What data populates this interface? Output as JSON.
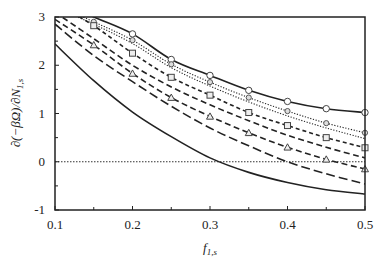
{
  "chart_data": {
    "type": "line",
    "title": "",
    "xlabel": "f_{1,s}",
    "ylabel": "∂(−βΩ)/∂N_{1,s}",
    "xlim": [
      0.1,
      0.5
    ],
    "ylim": [
      -1,
      3
    ],
    "xticks": [
      "0.1",
      "0.2",
      "0.3",
      "0.4",
      "0.5"
    ],
    "yticks": [
      "-1",
      "0",
      "1",
      "2",
      "3"
    ],
    "grid": false,
    "legend": null,
    "reference_line": {
      "y": 0,
      "style": "dotted"
    },
    "x": [
      0.1,
      0.15,
      0.2,
      0.25,
      0.3,
      0.35,
      0.4,
      0.45,
      0.5
    ],
    "series": [
      {
        "name": "curve-1",
        "style": "solid",
        "marker": "circle",
        "values": [
          3.35,
          3.0,
          2.65,
          2.12,
          1.79,
          1.48,
          1.25,
          1.1,
          1.02
        ]
      },
      {
        "name": "curve-2",
        "style": "dotted",
        "marker": "diamond",
        "values": [
          3.25,
          2.9,
          2.52,
          2.02,
          1.65,
          1.33,
          1.05,
          0.8,
          0.6
        ]
      },
      {
        "name": "curve-3",
        "style": "dotted",
        "marker": "none",
        "values": [
          3.2,
          2.85,
          2.45,
          1.95,
          1.57,
          1.24,
          0.95,
          0.7,
          0.48
        ]
      },
      {
        "name": "curve-4",
        "style": "short-dash",
        "marker": "square",
        "values": [
          3.3,
          2.82,
          2.25,
          1.75,
          1.38,
          1.02,
          0.75,
          0.5,
          0.29
        ]
      },
      {
        "name": "curve-5",
        "style": "dash",
        "marker": "none",
        "values": [
          3.1,
          2.55,
          2.0,
          1.55,
          1.18,
          0.85,
          0.55,
          0.3,
          0.08
        ]
      },
      {
        "name": "curve-6",
        "style": "dash",
        "marker": "triangle",
        "values": [
          2.95,
          2.42,
          1.83,
          1.33,
          0.94,
          0.6,
          0.3,
          0.05,
          -0.15
        ]
      },
      {
        "name": "curve-7",
        "style": "long-dash",
        "marker": "none",
        "values": [
          2.85,
          2.2,
          1.66,
          1.15,
          0.7,
          0.33,
          0.0,
          -0.25,
          -0.46
        ]
      },
      {
        "name": "curve-8",
        "style": "solid",
        "marker": "none",
        "values": [
          2.44,
          1.68,
          1.03,
          0.52,
          0.08,
          -0.22,
          -0.43,
          -0.58,
          -0.67
        ]
      }
    ]
  }
}
